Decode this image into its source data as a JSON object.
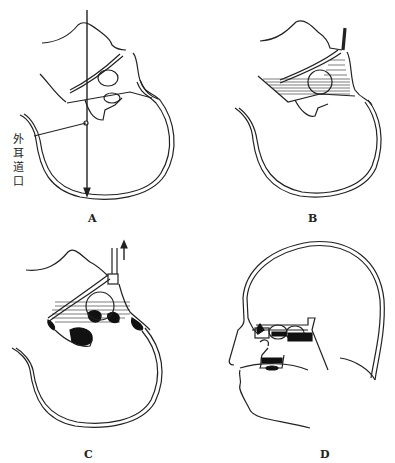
{
  "figure": {
    "panels": [
      {
        "id": "A",
        "label": "A",
        "annotation": {
          "chars": [
            "外",
            "耳",
            "道",
            "口"
          ],
          "text": "外耳道口"
        }
      },
      {
        "id": "B",
        "label": "B"
      },
      {
        "id": "C",
        "label": "C"
      },
      {
        "id": "D",
        "label": "D"
      }
    ],
    "colors": {
      "line": "#222222",
      "fill": "#111111",
      "background": "#ffffff"
    }
  }
}
